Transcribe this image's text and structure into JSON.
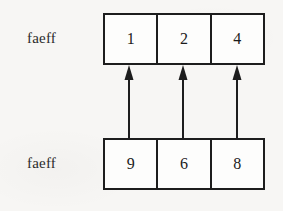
{
  "diagram": {
    "type": "array-mapping",
    "rows": [
      {
        "id": "top",
        "label": "faeff",
        "cells": [
          "1",
          "2",
          "4"
        ]
      },
      {
        "id": "bottom",
        "label": "faeff",
        "cells": [
          "9",
          "6",
          "8"
        ]
      }
    ],
    "arrows": {
      "count": 3,
      "direction": "upward",
      "description": "vertical arrows from bottom row cells to top row cells"
    },
    "colors": {
      "stroke": "#1d1d1d",
      "text": "#1b1b1b",
      "box_fill": "#fdfdfc",
      "background": "#f7f6f4"
    }
  }
}
